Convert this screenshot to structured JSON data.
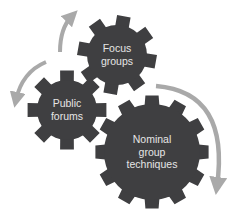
{
  "diagram": {
    "type": "cycle-gears",
    "colors": {
      "gear": "#3f3f41",
      "arrow": "#a9a9a9",
      "label": "#e6e6e6",
      "background": "#ffffff"
    },
    "gears": [
      {
        "id": "focus",
        "lines": [
          "Focus",
          "groups"
        ],
        "cx": 117,
        "cy": 55,
        "r_body": 29,
        "r_tip": 40,
        "teeth": 8,
        "rotation": 10,
        "font_size": 10.5
      },
      {
        "id": "public",
        "lines": [
          "Public",
          "forums"
        ],
        "cx": 67,
        "cy": 110,
        "r_body": 29,
        "r_tip": 40,
        "teeth": 8,
        "rotation": 0,
        "font_size": 10.5
      },
      {
        "id": "nominal",
        "lines": [
          "Nominal",
          "group",
          "techniques"
        ],
        "cx": 152,
        "cy": 152,
        "r_body": 47,
        "r_tip": 57,
        "teeth": 12,
        "rotation": 0,
        "font_size": 10.5
      }
    ],
    "arrows": [
      {
        "id": "arrow-to-focus",
        "from": "public",
        "to": "focus"
      },
      {
        "id": "arrow-to-public",
        "from": "focus",
        "to": "public"
      },
      {
        "id": "arrow-to-nominal-bottom",
        "from": "nominal-top",
        "to": "nominal-bottom"
      }
    ]
  }
}
